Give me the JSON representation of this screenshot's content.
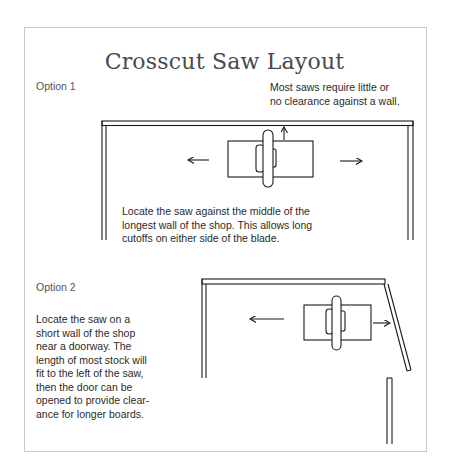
{
  "title": "Crosscut Saw Layout",
  "option1": {
    "label": "Option 1",
    "note_lines": [
      "Most saws require little or",
      "no clearance against a wall."
    ],
    "desc_lines": [
      "Locate the saw against the middle of the",
      "longest wall of the shop. This allows long",
      "cutoffs on either side of the blade."
    ]
  },
  "option2": {
    "label": "Option 2",
    "desc_lines": [
      "Locate the saw on a",
      "short wall of the shop",
      "near a doorway. The",
      "length of most stock will",
      "fit to the left of the saw,",
      "then the door can be",
      "opened to provide clear-",
      "ance for longer boards."
    ]
  },
  "colors": {
    "line": "#1a1a1a",
    "frame": "#c8c8c8",
    "title": "#4a4a4a"
  }
}
